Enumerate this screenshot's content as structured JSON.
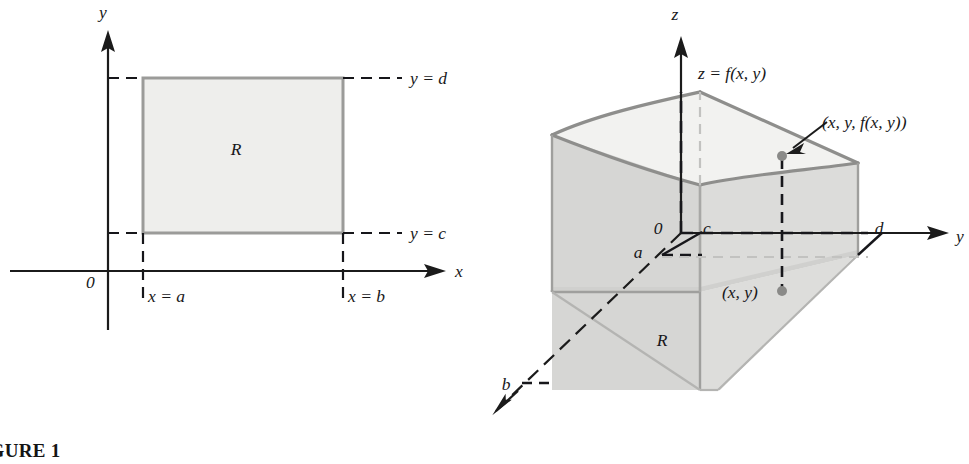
{
  "page": {
    "background_color": "#ffffff",
    "width": 969,
    "height": 464
  },
  "figure1": {
    "caption": "FIGURE 1",
    "axes": {
      "x_axis_label": "x",
      "y_axis_label": "y",
      "origin_label": "0"
    },
    "region_label": "R",
    "boundary_labels": {
      "top": "y = d",
      "bottom": "y = c",
      "left": "x = a",
      "right": "x = b"
    },
    "colors": {
      "rect_fill": "#eeeeec",
      "rect_stroke": "#9b9b99",
      "axis": "#1b1b1b",
      "dashed": "#16161a"
    }
  },
  "figure2": {
    "caption": "FIGURE 2",
    "axes": {
      "x_axis_label": "x",
      "y_axis_label": "y",
      "z_axis_label": "z",
      "origin_label": "0"
    },
    "surface_label": "z = f(x, y)",
    "point_3d_label": "(x, y, f(x, y))",
    "point_2d_label": "(x, y)",
    "region_label": "R",
    "bound_labels": {
      "a": "a",
      "b": "b",
      "c": "c",
      "d": "d"
    },
    "colors": {
      "front_face": "#d6d6d4",
      "side_face": "#dcdcda",
      "top_face": "#f2f2f0",
      "surface_stroke": "#8e8e8c",
      "axis": "#1b1b1b",
      "dashed": "#17171b",
      "point": "#8a8a88"
    }
  }
}
